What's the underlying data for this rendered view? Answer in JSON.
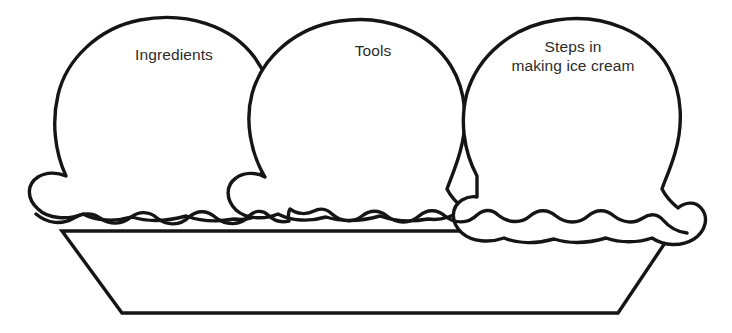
{
  "worksheet": {
    "title": "Ice Cream Scoops Graphic Organizer",
    "background_color": "#ffffff",
    "line_color": "#151515",
    "text_color": "#2b2b2b"
  },
  "scoops": [
    {
      "id": "ingredients",
      "label": "Ingredients",
      "position": "left"
    },
    {
      "id": "tools",
      "label": "Tools",
      "position": "center"
    },
    {
      "id": "steps",
      "label": "Steps in\nmaking ice cream",
      "position": "right"
    }
  ],
  "bowl": {
    "name": "ice-cream-bowl",
    "shape": "trapezoid"
  }
}
